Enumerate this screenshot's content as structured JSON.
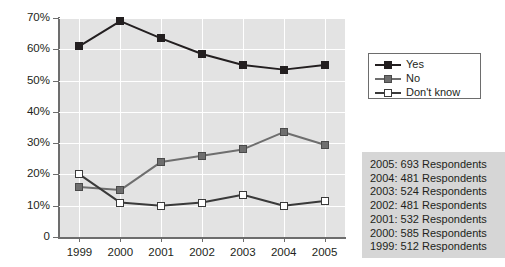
{
  "chart_data": {
    "type": "line",
    "title": "",
    "xlabel": "",
    "ylabel": "",
    "categories": [
      "1999",
      "2000",
      "2001",
      "2002",
      "2003",
      "2004",
      "2005"
    ],
    "ylim": [
      0,
      70
    ],
    "ytick_values": [
      0,
      10,
      20,
      30,
      40,
      50,
      60,
      70
    ],
    "ytick_labels": [
      "0",
      "10%",
      "20%",
      "30%",
      "40%",
      "50%",
      "60%",
      "70%"
    ],
    "grid": "horizontal-and-vertical",
    "legend_position": "right-top",
    "series": [
      {
        "name": "Yes",
        "color": "#231f20",
        "marker": "filled-square",
        "values": [
          61,
          69,
          63.5,
          58.5,
          55,
          53.5,
          55
        ]
      },
      {
        "name": "No",
        "color": "#6e6e6e",
        "marker": "gray-square",
        "values": [
          16,
          15,
          24,
          26,
          28,
          33.5,
          29.5
        ]
      },
      {
        "name": "Don't know",
        "color": "#3a3a3a",
        "marker": "open-square",
        "values": [
          20,
          11,
          10,
          11,
          13.5,
          10,
          11.5
        ]
      }
    ],
    "annotations": [
      "2005: 693 Respondents",
      "2004: 481 Respondents",
      "2003: 524 Respondents",
      "2002: 481 Respondents",
      "2001: 532 Respondents",
      "2000: 585 Respondents",
      "1999: 512 Respondents"
    ]
  },
  "legend": {
    "items": [
      {
        "label": "Yes"
      },
      {
        "label": "No"
      },
      {
        "label": "Don't know"
      }
    ]
  },
  "respondents": {
    "lines": [
      "2005: 693 Respondents",
      "2004: 481 Respondents",
      "2003: 524 Respondents",
      "2002: 481 Respondents",
      "2001: 532 Respondents",
      "2000: 585 Respondents",
      "1999: 512 Respondents"
    ]
  }
}
